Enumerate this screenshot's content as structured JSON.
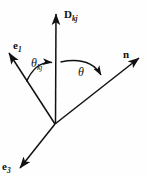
{
  "figure": {
    "background_color": "#fefefe",
    "stroke_color": "#111111",
    "width": 148,
    "height": 178,
    "origin": {
      "x": 55,
      "y": 124
    }
  },
  "vectors": [
    {
      "id": "D",
      "name": "D-vector",
      "label_base": "D",
      "label_sub": "kj",
      "direction": "up",
      "tip": {
        "x": 56,
        "y": 9
      }
    },
    {
      "id": "e1",
      "name": "e1-vector",
      "label_base": "e",
      "label_sub": "1",
      "direction": "up-left",
      "tip": {
        "x": 5,
        "y": 50
      }
    },
    {
      "id": "n",
      "name": "n-vector",
      "label_base": "n",
      "label_sub": "",
      "direction": "up-right",
      "tip": {
        "x": 144,
        "y": 54
      }
    },
    {
      "id": "e3",
      "name": "e3-vector",
      "label_base": "e",
      "label_sub": "3",
      "direction": "down-left",
      "tip": {
        "x": 16,
        "y": 172
      }
    }
  ],
  "angles": [
    {
      "id": "theta_kj",
      "name": "theta-kj-angle",
      "label_base": "θ",
      "label_sub": "kj",
      "between": [
        "e1",
        "D"
      ],
      "arrowhead_at": "D"
    },
    {
      "id": "theta",
      "name": "theta-angle",
      "label_base": "θ",
      "label_sub": "",
      "between": [
        "D",
        "n"
      ],
      "arrowhead_at": "n"
    }
  ]
}
